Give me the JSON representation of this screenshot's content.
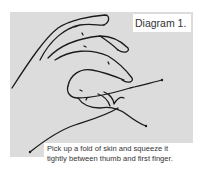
{
  "diagram": {
    "title": "Diagram 1.",
    "caption_line1": "Pick up a fold of skin and squeeze it",
    "caption_line2": "tightly between thumb and first finger.",
    "illustration": "hand-pinching-skin-fold"
  }
}
